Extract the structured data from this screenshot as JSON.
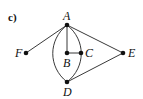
{
  "figure": {
    "panel_label": "c)",
    "nodes": [
      {
        "id": "A",
        "label": "A",
        "x": 67,
        "y": 25
      },
      {
        "id": "B",
        "label": "B",
        "x": 67,
        "y": 53
      },
      {
        "id": "C",
        "label": "C",
        "x": 81,
        "y": 53
      },
      {
        "id": "D",
        "label": "D",
        "x": 67,
        "y": 82
      },
      {
        "id": "E",
        "label": "E",
        "x": 123,
        "y": 53
      },
      {
        "id": "F",
        "label": "F",
        "x": 26,
        "y": 53
      }
    ],
    "edges": [
      {
        "from": "A",
        "to": "F",
        "type": "straight"
      },
      {
        "from": "A",
        "to": "B",
        "type": "straight"
      },
      {
        "from": "B",
        "to": "C",
        "type": "straight"
      },
      {
        "from": "A",
        "to": "E",
        "type": "straight"
      },
      {
        "from": "D",
        "to": "E",
        "type": "straight"
      },
      {
        "from": "A",
        "to": "D",
        "type": "arc-left"
      },
      {
        "from": "A",
        "to": "D",
        "type": "arc-right"
      }
    ]
  }
}
